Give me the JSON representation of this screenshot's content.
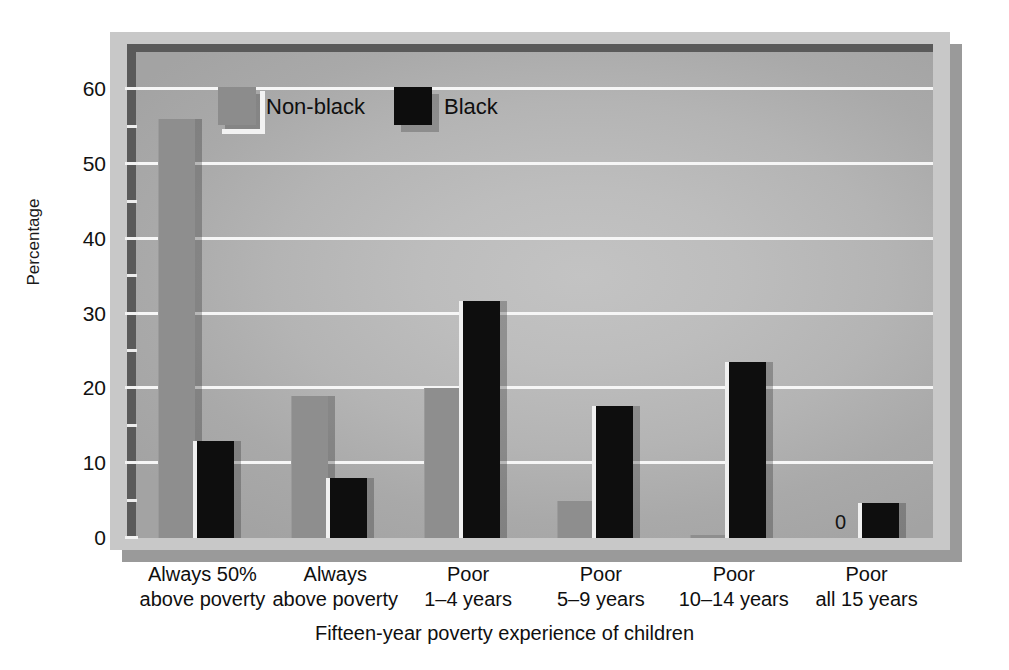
{
  "chart_data": {
    "type": "bar",
    "title": "",
    "xlabel": "Fifteen-year poverty experience of children",
    "ylabel": "Percentage",
    "ylim": [
      0,
      65
    ],
    "yticks": [
      0,
      10,
      20,
      30,
      40,
      50,
      60
    ],
    "ytick_labels": [
      "0",
      "10",
      "20",
      "30",
      "40",
      "50",
      "60"
    ],
    "minor_tick_interval": 5,
    "grid": true,
    "grid_axis": "y",
    "legend_position": "upper-left-inside",
    "categories": [
      "Always 50% above poverty",
      "Always above poverty",
      "Poor 1–4 years",
      "Poor 5–9 years",
      "Poor 10–14 years",
      "Poor all 15 years"
    ],
    "category_lines": [
      {
        "line1": "Always 50%",
        "line2": "above poverty"
      },
      {
        "line1": "Always",
        "line2": "above poverty"
      },
      {
        "line1": "Poor",
        "line2": "1–4 years"
      },
      {
        "line1": "Poor",
        "line2": "5–9 years"
      },
      {
        "line1": "Poor",
        "line2": "10–14 years"
      },
      {
        "line1": "Poor",
        "line2": "all 15 years"
      }
    ],
    "series": [
      {
        "name": "Non-black",
        "color": "#8e8e8e",
        "values": [
          56,
          19,
          20,
          5,
          0.3,
          0
        ]
      },
      {
        "name": "Black",
        "color": "#0e0e0e",
        "values": [
          13,
          8,
          31.7,
          17.6,
          23.6,
          4.7
        ]
      }
    ],
    "annotations": [
      {
        "text": "0",
        "category": "Poor all 15 years",
        "series": "Non-black"
      }
    ]
  },
  "legend": {
    "entries": [
      {
        "label": "Non-black",
        "swatch": "gray-swatch"
      },
      {
        "label": "Black",
        "swatch": "black-swatch"
      }
    ]
  },
  "axes": {
    "y_title": "Percentage",
    "x_title": "Fifteen-year poverty experience of children",
    "y_tick_labels": [
      "60",
      "50",
      "40",
      "30",
      "20",
      "10",
      "0"
    ]
  },
  "colors": {
    "nonblack_bar": "#8e8e8e",
    "black_bar": "#0e0e0e",
    "panel": "#c8c8c8",
    "plot_background": "#b8b8b8",
    "gridline": "#f6f6f6",
    "shadow": "#9a9a9a"
  }
}
